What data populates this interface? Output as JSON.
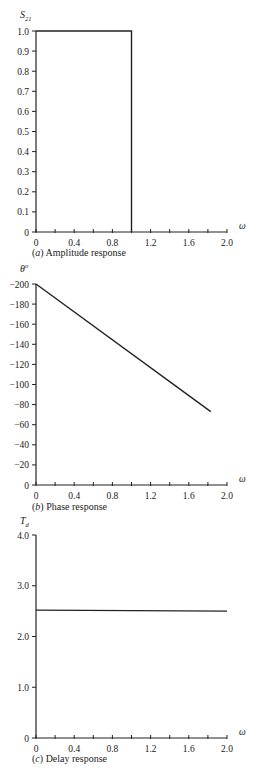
{
  "chart_data": [
    {
      "type": "line",
      "title": "(a) Amplitude response",
      "caption_letter": "(a)",
      "caption_text": "Amplitude response",
      "ylabel": "S21",
      "xlabel": "ω",
      "xlim": [
        0,
        2.0
      ],
      "ylim": [
        0,
        1.0
      ],
      "x_ticks": [
        "0",
        "0.4",
        "0.8",
        "1.2",
        "1.6",
        "2.0"
      ],
      "y_ticks": [
        "0",
        "0.1",
        "0.2",
        "0.3",
        "0.4",
        "0.5",
        "0.6",
        "0.7",
        "0.8",
        "0.9",
        "1.0"
      ],
      "grid": false,
      "series": [
        {
          "name": "S21",
          "x": [
            0,
            1.0,
            1.0
          ],
          "y": [
            1.0,
            1.0,
            0
          ]
        }
      ]
    },
    {
      "type": "line",
      "title": "(b) Phase response",
      "caption_letter": "(b)",
      "caption_text": "Phase response",
      "ylabel": "θ°",
      "xlabel": "ω",
      "xlim": [
        0,
        2.0
      ],
      "ylim": [
        -200,
        0
      ],
      "x_ticks": [
        "0",
        "0.4",
        "0.8",
        "1.2",
        "1.6",
        "2.0"
      ],
      "y_ticks": [
        "0",
        "−20",
        "−40",
        "−60",
        "−80",
        "−100",
        "−120",
        "−140",
        "−160",
        "−180",
        "−200"
      ],
      "grid": false,
      "series": [
        {
          "name": "phase",
          "x": [
            0,
            1.83
          ],
          "y": [
            0,
            -127
          ]
        }
      ]
    },
    {
      "type": "line",
      "title": "(c) Delay response",
      "caption_letter": "(c)",
      "caption_text": "Delay response",
      "ylabel": "Td",
      "xlabel": "ω",
      "xlim": [
        0,
        2.0
      ],
      "ylim": [
        0,
        4.0
      ],
      "x_ticks": [
        "0",
        "0.4",
        "0.8",
        "1.2",
        "1.6",
        "2.0"
      ],
      "y_ticks": [
        "0",
        "1.0",
        "2.0",
        "3.0",
        "4.0"
      ],
      "grid": false,
      "series": [
        {
          "name": "Td",
          "x": [
            0,
            2.0
          ],
          "y": [
            2.52,
            2.5
          ]
        }
      ]
    }
  ]
}
